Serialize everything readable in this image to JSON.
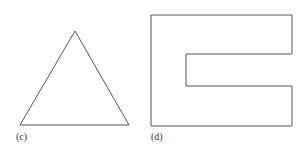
{
  "figures": [
    {
      "id": "c",
      "label": "(c)",
      "shape": "triangle",
      "points": [
        [
          75,
          31
        ],
        [
          20,
          125
        ],
        [
          129,
          125
        ]
      ],
      "label_pos": [
        16,
        131
      ]
    },
    {
      "id": "d",
      "label": "(d)",
      "shape": "e-shape",
      "points": [
        [
          151,
          15
        ],
        [
          292,
          15
        ],
        [
          292,
          54
        ],
        [
          186,
          54
        ],
        [
          186,
          86
        ],
        [
          292,
          86
        ],
        [
          292,
          126
        ],
        [
          151,
          126
        ]
      ],
      "label_pos": [
        151,
        131
      ]
    }
  ],
  "colors": {
    "stroke": "#555555",
    "background": "#ffffff"
  }
}
